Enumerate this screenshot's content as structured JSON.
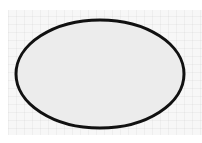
{
  "canvas": {
    "width": 202,
    "height": 143,
    "background": "#f7f7f7",
    "grid": true
  },
  "shape": {
    "type": "ellipse",
    "cx": 100,
    "cy": 74,
    "rx": 84,
    "ry": 54,
    "fill": "#ececec",
    "stroke": "#111111",
    "stroke_width": 3
  }
}
